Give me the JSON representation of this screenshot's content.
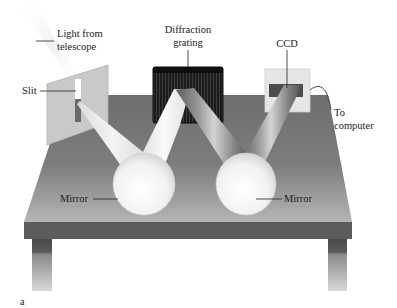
{
  "figure": {
    "panel_label": "a"
  },
  "labels": {
    "light_source_line1": "Light from",
    "light_source_line2": "telescope",
    "slit": "Slit",
    "grating_line1": "Diffraction",
    "grating_line2": "grating",
    "ccd": "CCD",
    "computer_line1": "To",
    "computer_line2": "computer",
    "mirror_left": "Mirror",
    "mirror_right": "Mirror"
  },
  "colors": {
    "table_top": "#7a7a7a",
    "table_edge": "#5a5a5a",
    "grating": "#1a1a1a",
    "beam": "#f2f2f2",
    "mirror": "#f8f8f8",
    "ccd_panel": "#e4e4e4",
    "ccd_sensor": "#4a4a4a"
  }
}
